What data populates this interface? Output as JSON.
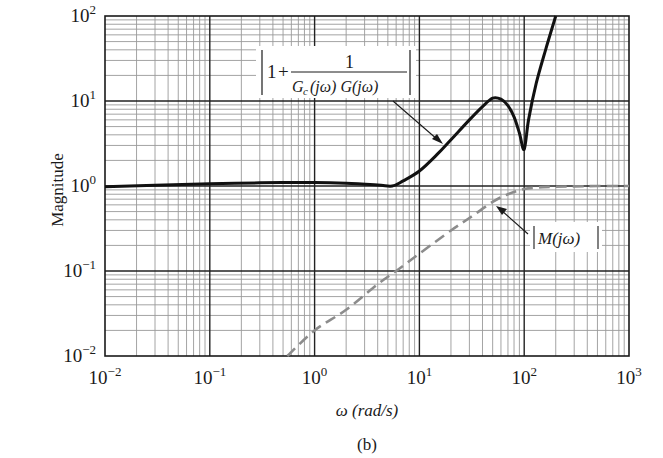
{
  "chart_data": {
    "type": "line",
    "title": "",
    "caption": "(b)",
    "xlabel": "ω (rad/s)",
    "ylabel": "Magnitude",
    "xscale": "log",
    "yscale": "log",
    "xlim": [
      0.01,
      1000
    ],
    "ylim": [
      0.01,
      100
    ],
    "grid": true,
    "x_ticks": [
      {
        "base": "10",
        "exp": "−2",
        "value": 0.01
      },
      {
        "base": "10",
        "exp": "−1",
        "value": 0.1
      },
      {
        "base": "10",
        "exp": "0",
        "value": 1
      },
      {
        "base": "10",
        "exp": "1",
        "value": 10
      },
      {
        "base": "10",
        "exp": "2",
        "value": 100
      },
      {
        "base": "10",
        "exp": "3",
        "value": 1000
      }
    ],
    "y_ticks": [
      {
        "base": "10",
        "exp": "−2",
        "value": 0.01
      },
      {
        "base": "10",
        "exp": "−1",
        "value": 0.1
      },
      {
        "base": "10",
        "exp": "0",
        "value": 1
      },
      {
        "base": "10",
        "exp": "1",
        "value": 10
      },
      {
        "base": "10",
        "exp": "2",
        "value": 100
      }
    ],
    "series": [
      {
        "name": "|1 + 1/(Gc(jω) G(jω))|",
        "style": "solid",
        "color": "#111111",
        "x": [
          0.01,
          0.03,
          0.1,
          0.3,
          1,
          2,
          4,
          5.5,
          7,
          10,
          15,
          20,
          30,
          40,
          50,
          60,
          70,
          80,
          90,
          100,
          110,
          130,
          160,
          200
        ],
        "values": [
          0.98,
          1.02,
          1.06,
          1.09,
          1.1,
          1.08,
          1.03,
          1.0,
          1.15,
          1.5,
          2.4,
          3.5,
          6.0,
          8.6,
          10.8,
          10.5,
          8.8,
          6.5,
          4.2,
          2.7,
          6.0,
          16,
          40,
          100
        ]
      },
      {
        "name": "|M(jω)|",
        "style": "dashed",
        "color": "#8c8c8c",
        "x": [
          0.55,
          1,
          2,
          4,
          6,
          10,
          20,
          30,
          50,
          70,
          100,
          150,
          200,
          300,
          500,
          1000
        ],
        "values": [
          0.01,
          0.02,
          0.035,
          0.07,
          0.1,
          0.16,
          0.3,
          0.42,
          0.65,
          0.8,
          0.92,
          0.97,
          0.98,
          0.99,
          1.0,
          1.0
        ]
      }
    ],
    "annotations": [
      {
        "text_parts": {
          "one": "1",
          "plus": "+",
          "num": "1",
          "den_a": "G",
          "den_sub": "c",
          "den_b": "(jω) G(jω)"
        },
        "points_to_series": 0
      },
      {
        "text": "|M(jω)|",
        "points_to_series": 1
      }
    ]
  },
  "colors": {
    "major_grid": "#222222",
    "minor_grid": "#9a9a9a",
    "solid_curve": "#111111",
    "dashed_curve": "#8c8c8c"
  }
}
